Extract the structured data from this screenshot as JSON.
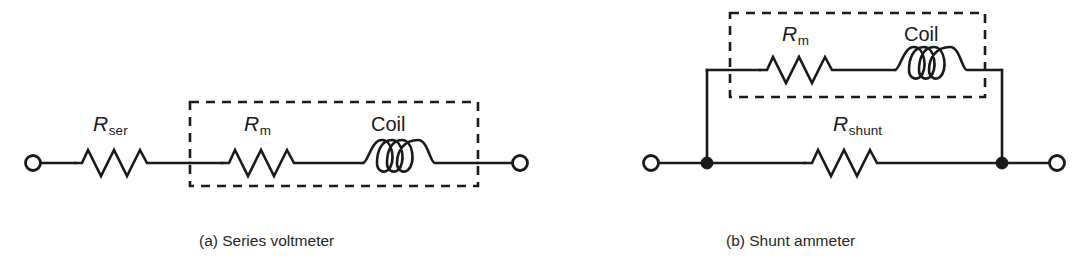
{
  "figure": {
    "background_color": "#ffffff",
    "line_color": "#1a1a1a",
    "width": 1075,
    "height": 274
  },
  "diagram_a": {
    "caption": "(a) Series voltmeter",
    "labels": {
      "series_resistor": "R",
      "series_resistor_sub": "ser",
      "meter_resistor": "R",
      "meter_resistor_sub": "m",
      "coil": "Coil"
    },
    "components": [
      {
        "name": "terminal-left",
        "type": "terminal",
        "symbol": "open-circle"
      },
      {
        "name": "resistor-ser",
        "type": "resistor",
        "label": "R_ser"
      },
      {
        "name": "resistor-m",
        "type": "resistor",
        "label": "R_m"
      },
      {
        "name": "coil",
        "type": "inductor",
        "label": "Coil",
        "turns": 3
      },
      {
        "name": "terminal-right",
        "type": "terminal",
        "symbol": "open-circle"
      }
    ],
    "dashed_enclosure": "movement (R_m in series with Coil)"
  },
  "diagram_b": {
    "caption": "(b) Shunt ammeter",
    "labels": {
      "meter_resistor": "R",
      "meter_resistor_sub": "m",
      "coil": "Coil",
      "shunt_resistor": "R",
      "shunt_resistor_sub": "shunt"
    },
    "components": [
      {
        "name": "terminal-left",
        "type": "terminal",
        "symbol": "open-circle"
      },
      {
        "name": "junction-left",
        "type": "junction",
        "symbol": "filled-dot"
      },
      {
        "name": "resistor-m",
        "type": "resistor",
        "label": "R_m"
      },
      {
        "name": "coil",
        "type": "inductor",
        "label": "Coil",
        "turns": 3
      },
      {
        "name": "resistor-shunt",
        "type": "resistor",
        "label": "R_shunt"
      },
      {
        "name": "junction-right",
        "type": "junction",
        "symbol": "filled-dot"
      },
      {
        "name": "terminal-right",
        "type": "terminal",
        "symbol": "open-circle"
      }
    ],
    "dashed_enclosure": "movement (R_m in series with Coil)"
  }
}
